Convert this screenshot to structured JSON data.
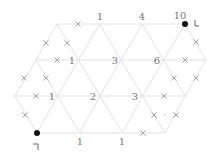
{
  "puzzle": {
    "type": "triangular-grid-loop",
    "grid": {
      "rows": [
        {
          "y": 24,
          "x_start": 57,
          "x_end": 185
        },
        {
          "y": 60,
          "x_start": 36,
          "x_end": 206
        },
        {
          "y": 96,
          "x_start": 15,
          "x_end": 185
        },
        {
          "y": 133,
          "x_start": 37,
          "x_end": 165
        }
      ],
      "color": "#e2e2e2"
    },
    "numbers": [
      {
        "label": "1",
        "x": 100,
        "y": 20
      },
      {
        "label": "4",
        "x": 142,
        "y": 20
      },
      {
        "label": "10",
        "x": 180,
        "y": 19
      },
      {
        "label": "1",
        "x": 72,
        "y": 64
      },
      {
        "label": "3",
        "x": 115,
        "y": 64
      },
      {
        "label": "6",
        "x": 157,
        "y": 64
      },
      {
        "label": "1",
        "x": 52,
        "y": 100
      },
      {
        "label": "2",
        "x": 93,
        "y": 100
      },
      {
        "label": "3",
        "x": 135,
        "y": 100
      },
      {
        "label": "1",
        "x": 80,
        "y": 145
      },
      {
        "label": "1",
        "x": 122,
        "y": 145
      }
    ],
    "dots": [
      {
        "x": 185,
        "y": 24
      },
      {
        "x": 37,
        "y": 133
      }
    ],
    "small_dots": [
      {
        "x": 165,
        "y": 115
      }
    ],
    "crosses": [
      {
        "x": 78,
        "y": 24
      },
      {
        "x": 46,
        "y": 43
      },
      {
        "x": 67,
        "y": 43
      },
      {
        "x": 57,
        "y": 60
      },
      {
        "x": 24,
        "y": 78
      },
      {
        "x": 46,
        "y": 78
      },
      {
        "x": 36,
        "y": 96
      },
      {
        "x": 25,
        "y": 115
      },
      {
        "x": 196,
        "y": 42
      },
      {
        "x": 185,
        "y": 60
      },
      {
        "x": 174,
        "y": 78
      },
      {
        "x": 196,
        "y": 78
      },
      {
        "x": 164,
        "y": 96
      },
      {
        "x": 154,
        "y": 115
      },
      {
        "x": 176,
        "y": 115
      },
      {
        "x": 143,
        "y": 133
      }
    ],
    "corner_marks": [
      {
        "name": "top-right-corner-mark",
        "x": 195,
        "y": 20,
        "shape": "L"
      },
      {
        "name": "bottom-left-corner-mark",
        "x": 33,
        "y": 144,
        "shape": "rev-L"
      }
    ]
  }
}
